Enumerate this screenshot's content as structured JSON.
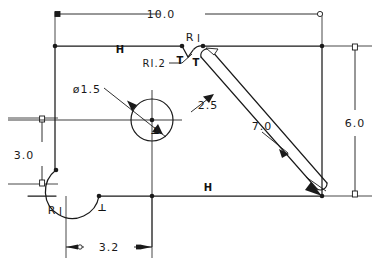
{
  "drawing": {
    "type": "cad-parametric-sketch",
    "title": "",
    "units": "",
    "line_color": "#1a1a1a",
    "background": "#ffffff"
  },
  "dimensions": [
    {
      "id": "overall-width",
      "value": "10.0",
      "kind": "linear-horizontal",
      "placement": "top"
    },
    {
      "id": "overall-height",
      "value": "6.0",
      "kind": "linear-vertical",
      "placement": "right"
    },
    {
      "id": "left-offset",
      "value": "3.0",
      "kind": "linear-vertical",
      "placement": "left"
    },
    {
      "id": "bottom-offset",
      "value": "3.2",
      "kind": "linear-horizontal",
      "placement": "bottom"
    },
    {
      "id": "slot-length",
      "value": "7.0",
      "kind": "linear-aligned",
      "placement": "slot-axis"
    },
    {
      "id": "slot-offset",
      "value": "2.5",
      "kind": "linear-aligned",
      "placement": "slot-upper"
    },
    {
      "id": "hole-diameter",
      "value": "ø1.5",
      "kind": "diameter",
      "placement": "leader"
    },
    {
      "id": "slot-end-radius",
      "value": "R1.2",
      "kind": "radius",
      "placement": "leader"
    },
    {
      "id": "notch-radius-top",
      "value": "R1",
      "kind": "radius",
      "placement": "top-notch"
    },
    {
      "id": "notch-radius-bottom",
      "value": "R1",
      "kind": "radius",
      "placement": "bottom-arc"
    }
  ],
  "constraints": [
    {
      "id": "horizontal-top",
      "symbol": "H",
      "meaning": "horizontal"
    },
    {
      "id": "horizontal-bottom",
      "symbol": "H",
      "meaning": "horizontal"
    },
    {
      "id": "tangent-left",
      "symbol": "T",
      "meaning": "tangent"
    },
    {
      "id": "tangent-right",
      "symbol": "T",
      "meaning": "tangent"
    },
    {
      "id": "perpendicular-bottom",
      "symbol": "⊥",
      "meaning": "perpendicular"
    },
    {
      "id": "perpendicular-hole",
      "symbol": "⊥",
      "meaning": "perpendicular"
    }
  ],
  "labels": {
    "width_10": "10.0",
    "height_6": "6.0",
    "left_3": "3.0",
    "bottom_32": "3.2",
    "slot_7": "7.0",
    "offset_25": "2.5",
    "dia_15": "ø1.5",
    "rad_12": "RI.2",
    "r1_top": "R",
    "r1_top_sub": "I",
    "r1_bottom": "R",
    "r1_bottom_sub": "I",
    "h_top": "H",
    "h_bottom": "H",
    "t_left": "T",
    "t_right": "T",
    "perp_bottom": "⊥",
    "perp_hole": "⊥"
  }
}
